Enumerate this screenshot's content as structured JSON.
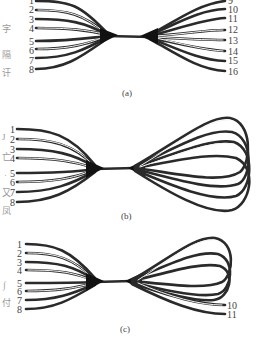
{
  "figure": {
    "panels": [
      {
        "id": "a",
        "caption": "(a)",
        "left_labels": [
          "1",
          "2",
          "3",
          "4",
          "5",
          "6",
          "7",
          "8"
        ],
        "right_labels": [
          "9",
          "10",
          "11",
          "12",
          "13",
          "14",
          "15",
          "16"
        ],
        "description": "8 fibers fan in on left, pass through a narrow waist, fan out to 8 separate ends on the right"
      },
      {
        "id": "b",
        "caption": "(b)",
        "left_labels": [
          "1",
          "2",
          "3",
          "4",
          "5",
          "6",
          "7",
          "8"
        ],
        "right_labels": [],
        "description": "8 fibers fan in on left, through the waist, then loop back on themselves on the right"
      },
      {
        "id": "c",
        "caption": "(c)",
        "left_labels": [
          "1",
          "2",
          "3",
          "4",
          "5",
          "6",
          "7",
          "8"
        ],
        "right_labels": [
          "10",
          "11"
        ],
        "description": "8 fibers fan in on left, through the waist; most loop back on the right, two exit as ends 10 and 11"
      }
    ],
    "margin_fragments": [
      "字",
      "隔",
      "讦",
      "J",
      "亡",
      "·",
      "又",
      "凤",
      "∫",
      "付"
    ],
    "colors": {
      "line": "#2a2a2a",
      "background": "#ffffff",
      "text": "#444444"
    }
  }
}
